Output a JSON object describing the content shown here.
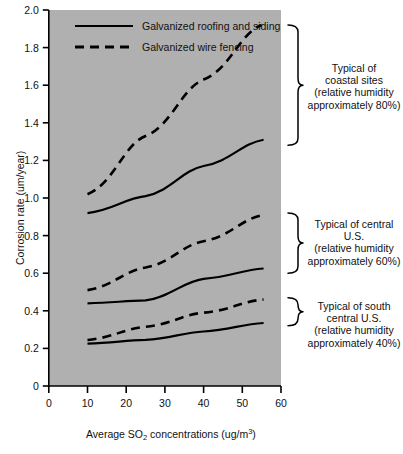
{
  "chart_data": {
    "type": "line",
    "title": "",
    "xlabel": "Average SO2 concentrations (ug/m3)",
    "xlabel_parts": {
      "pre": "Average SO",
      "sub": "2",
      "mid": " concentrations (ug/m",
      "sup": "3",
      "post": ")"
    },
    "ylabel": "Corrosion rate (um/year)",
    "xlim": [
      0,
      60
    ],
    "ylim": [
      0,
      2.0
    ],
    "xticks": [
      "0",
      "10",
      "20",
      "30",
      "40",
      "50",
      "60"
    ],
    "xtick_values": [
      0,
      10,
      20,
      30,
      40,
      50,
      60
    ],
    "yticks": [
      "0",
      "0.2",
      "0.4",
      "0.6",
      "0.8",
      "1.0",
      "1.2",
      "1.4",
      "1.6",
      "1.8",
      "2.0"
    ],
    "ytick_values": [
      0,
      0.2,
      0.4,
      0.6,
      0.8,
      1.0,
      1.2,
      1.4,
      1.6,
      1.8,
      2.0
    ],
    "grid": false,
    "plot_bgcolor": "#b0b0b0",
    "line_color": "#000000",
    "legend": {
      "position": "top-left-inside",
      "entries": [
        {
          "label": "Galvanized roofing and siding",
          "style": "solid"
        },
        {
          "label": "Galvanized wire fencing",
          "style": "dashed"
        }
      ]
    },
    "series": [
      {
        "name": "Coastal sites - galvanized wire fencing",
        "group": "coastal",
        "style": "dashed",
        "x": [
          10,
          25,
          40,
          55
        ],
        "y": [
          1.02,
          1.33,
          1.63,
          1.92
        ]
      },
      {
        "name": "Coastal sites - galvanized roofing and siding",
        "group": "coastal",
        "style": "solid",
        "x": [
          10,
          25,
          40,
          55.5
        ],
        "y": [
          0.92,
          1.01,
          1.17,
          1.31
        ]
      },
      {
        "name": "Central U.S. - galvanized wire fencing",
        "group": "central",
        "style": "dashed",
        "x": [
          10,
          25,
          40,
          55.5
        ],
        "y": [
          0.51,
          0.63,
          0.77,
          0.91
        ]
      },
      {
        "name": "Central U.S. - galvanized roofing and siding",
        "group": "central",
        "style": "solid",
        "x": [
          10,
          25,
          40,
          55.5
        ],
        "y": [
          0.44,
          0.455,
          0.57,
          0.625
        ]
      },
      {
        "name": "South central U.S. - galvanized wire fencing",
        "group": "south-central",
        "style": "dashed",
        "x": [
          10,
          25,
          40,
          55.5
        ],
        "y": [
          0.245,
          0.315,
          0.39,
          0.46
        ]
      },
      {
        "name": "South central U.S. - galvanized roofing and siding",
        "group": "south-central",
        "style": "solid",
        "x": [
          10,
          25,
          40,
          55.5
        ],
        "y": [
          0.225,
          0.245,
          0.29,
          0.335
        ]
      }
    ],
    "annotations": [
      {
        "id": "coastal",
        "lines": [
          "Typical of",
          "coastal sites",
          "(relative humidity",
          "approximately 80%)"
        ],
        "bracket_from_y": 1.92,
        "bracket_to_y": 1.28
      },
      {
        "id": "central",
        "lines": [
          "Typical of central",
          "U.S.",
          "(relative humidity",
          "approximately 60%)"
        ],
        "bracket_from_y": 0.92,
        "bracket_to_y": 0.6
      },
      {
        "id": "south-central",
        "lines": [
          "Typical of south",
          "central U.S.",
          "(relative humidity",
          "approximately 40%)"
        ],
        "bracket_from_y": 0.47,
        "bracket_to_y": 0.32
      }
    ]
  }
}
